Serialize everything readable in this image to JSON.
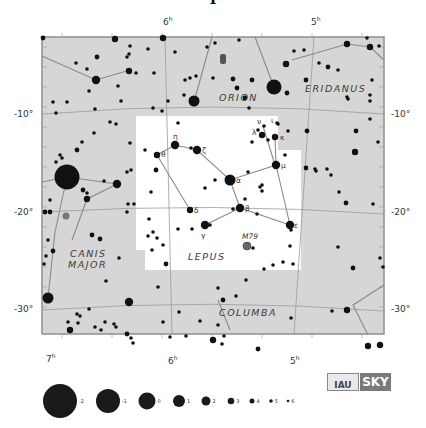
{
  "title_fragment": "Lepus",
  "colors": {
    "background": "#ffffff",
    "sky": "#d6d6d6",
    "lepus_area": "#ffffff",
    "grid": "#9a9a9a",
    "figure": "#8a8a8a",
    "star": "#111111",
    "border": "#8f8f8f"
  },
  "map": {
    "x": 42,
    "y": 37,
    "w": 342,
    "h": 297
  },
  "ra_labels": [
    {
      "text": "6",
      "sup": "h",
      "x": 163,
      "y": 25
    },
    {
      "text": "5",
      "sup": "h",
      "x": 311,
      "y": 25
    },
    {
      "text": "7",
      "sup": "h",
      "x": 46,
      "y": 362
    },
    {
      "text": "6",
      "sup": "h",
      "x": 168,
      "y": 364
    },
    {
      "text": "5",
      "sup": "h",
      "x": 290,
      "y": 364
    }
  ],
  "dec_labels": [
    {
      "text": "-10°",
      "x": 14,
      "y": 117,
      "side": "left"
    },
    {
      "text": "-20°",
      "x": 14,
      "y": 215,
      "side": "left"
    },
    {
      "text": "-30°",
      "x": 14,
      "y": 312,
      "side": "left"
    },
    {
      "text": "-10°",
      "x": 391,
      "y": 117,
      "side": "right"
    },
    {
      "text": "-20°",
      "x": 391,
      "y": 215,
      "side": "right"
    },
    {
      "text": "-30°",
      "x": 391,
      "y": 312,
      "side": "right"
    }
  ],
  "constellations": [
    {
      "name": "ORION",
      "x": 219,
      "y": 101
    },
    {
      "name": "ERIDANUS",
      "x": 305,
      "y": 92
    },
    {
      "name": "CANIS",
      "x": 70,
      "y": 257
    },
    {
      "name": "MAJOR",
      "x": 68,
      "y": 268
    },
    {
      "name": "LEPUS",
      "x": 188,
      "y": 260
    },
    {
      "name": "COLUMBA",
      "x": 219,
      "y": 316
    }
  ],
  "lepus_boundary": "M136,116 L278,116 L278,150 L301,150 L301,270 L145,270 L145,250 L136,250 Z",
  "grid_lines": [
    "M42,114 Q213,100 384,114",
    "M42,212 Q213,202 384,214",
    "M42,310 Q213,298 384,311",
    "M165,37 L172,334",
    "M314,37 L294,334"
  ],
  "figure_lines": [
    "M42,56 L96,80 L130,70",
    "M194,102 L212,37",
    "M274,87 L255,37",
    "M292,60 L347,44 L370,47 L384,60",
    "M42,182 L67,177 L117,184",
    "M67,177 L55,232 L48,298",
    "M117,184 L87,199 L72,240",
    "M157,155 L175,145 L197,150 L230,180 L276,165 L275,137",
    "M230,180 L240,208 L205,225",
    "M240,208 L290,225",
    "M157,155 L190,210",
    "M276,165 L290,225",
    "M263,126 L275,165",
    "M384,285 L353,305 L368,335",
    "M218,300 L230,330"
  ],
  "stars": [
    {
      "x": 43,
      "y": 38,
      "m": 4
    },
    {
      "x": 115,
      "y": 39,
      "m": 3
    },
    {
      "x": 163,
      "y": 38,
      "m": 3
    },
    {
      "x": 130,
      "y": 46,
      "m": 5
    },
    {
      "x": 129,
      "y": 54,
      "m": 5
    },
    {
      "x": 148,
      "y": 49,
      "m": 5
    },
    {
      "x": 175,
      "y": 52,
      "m": 5
    },
    {
      "x": 97,
      "y": 57,
      "m": 4
    },
    {
      "x": 127,
      "y": 57,
      "m": 5
    },
    {
      "x": 76,
      "y": 63,
      "m": 5
    },
    {
      "x": 87,
      "y": 69,
      "m": 5
    },
    {
      "x": 129,
      "y": 71,
      "m": 3
    },
    {
      "x": 136,
      "y": 73,
      "m": 5
    },
    {
      "x": 154,
      "y": 73,
      "m": 5
    },
    {
      "x": 96,
      "y": 80,
      "m": 2
    },
    {
      "x": 185,
      "y": 80,
      "m": 5
    },
    {
      "x": 89,
      "y": 91,
      "m": 5
    },
    {
      "x": 118,
      "y": 86,
      "m": 5
    },
    {
      "x": 121,
      "y": 101,
      "m": 5
    },
    {
      "x": 168,
      "y": 101,
      "m": 5
    },
    {
      "x": 184,
      "y": 95,
      "m": 5
    },
    {
      "x": 53,
      "y": 102,
      "m": 5
    },
    {
      "x": 67,
      "y": 102,
      "m": 5
    },
    {
      "x": 95,
      "y": 109,
      "m": 5
    },
    {
      "x": 56,
      "y": 113,
      "m": 5
    },
    {
      "x": 153,
      "y": 108,
      "m": 5
    },
    {
      "x": 162,
      "y": 111,
      "m": 5
    },
    {
      "x": 194,
      "y": 101,
      "m": 1
    },
    {
      "x": 215,
      "y": 43,
      "m": 5
    },
    {
      "x": 239,
      "y": 40,
      "m": 5
    },
    {
      "x": 207,
      "y": 47,
      "m": 5
    },
    {
      "x": 190,
      "y": 78,
      "m": 5
    },
    {
      "x": 196,
      "y": 76,
      "m": 5
    },
    {
      "x": 233,
      "y": 79,
      "m": 4
    },
    {
      "x": 245,
      "y": 98,
      "m": 4
    },
    {
      "x": 252,
      "y": 80,
      "m": 4
    },
    {
      "x": 213,
      "y": 78,
      "m": 5
    },
    {
      "x": 237,
      "y": 88,
      "m": 4
    },
    {
      "x": 274,
      "y": 87,
      "m": 0
    },
    {
      "x": 287,
      "y": 93,
      "m": 4
    },
    {
      "x": 286,
      "y": 64,
      "m": 3
    },
    {
      "x": 294,
      "y": 51,
      "m": 5
    },
    {
      "x": 304,
      "y": 50,
      "m": 5
    },
    {
      "x": 319,
      "y": 63,
      "m": 5
    },
    {
      "x": 328,
      "y": 67,
      "m": 4
    },
    {
      "x": 338,
      "y": 70,
      "m": 5
    },
    {
      "x": 306,
      "y": 80,
      "m": 4
    },
    {
      "x": 347,
      "y": 44,
      "m": 3
    },
    {
      "x": 370,
      "y": 47,
      "m": 3
    },
    {
      "x": 367,
      "y": 38,
      "m": 5
    },
    {
      "x": 379,
      "y": 46,
      "m": 5
    },
    {
      "x": 372,
      "y": 80,
      "m": 5
    },
    {
      "x": 370,
      "y": 95,
      "m": 5
    },
    {
      "x": 370,
      "y": 101,
      "m": 5
    },
    {
      "x": 347,
      "y": 97,
      "m": 5
    },
    {
      "x": 348,
      "y": 99,
      "m": 5
    },
    {
      "x": 249,
      "y": 108,
      "m": 5
    },
    {
      "x": 370,
      "y": 119,
      "m": 5
    },
    {
      "x": 356,
      "y": 131,
      "m": 4
    },
    {
      "x": 378,
      "y": 142,
      "m": 5
    },
    {
      "x": 355,
      "y": 152,
      "m": 3
    },
    {
      "x": 307,
      "y": 131,
      "m": 4
    },
    {
      "x": 306,
      "y": 168,
      "m": 4
    },
    {
      "x": 315,
      "y": 169,
      "m": 5
    },
    {
      "x": 316,
      "y": 171,
      "m": 5
    },
    {
      "x": 327,
      "y": 169,
      "m": 5
    },
    {
      "x": 331,
      "y": 175,
      "m": 5
    },
    {
      "x": 339,
      "y": 192,
      "m": 5
    },
    {
      "x": 346,
      "y": 203,
      "m": 4
    },
    {
      "x": 373,
      "y": 204,
      "m": 5
    },
    {
      "x": 338,
      "y": 247,
      "m": 5
    },
    {
      "x": 380,
      "y": 258,
      "m": 5
    },
    {
      "x": 383,
      "y": 267,
      "m": 5
    },
    {
      "x": 353,
      "y": 268,
      "m": 4
    },
    {
      "x": 332,
      "y": 311,
      "m": 5
    },
    {
      "x": 347,
      "y": 310,
      "m": 3
    },
    {
      "x": 368,
      "y": 346,
      "m": 3
    },
    {
      "x": 380,
      "y": 345,
      "m": 3
    },
    {
      "x": 110,
      "y": 122,
      "m": 5
    },
    {
      "x": 116,
      "y": 124,
      "m": 5
    },
    {
      "x": 94,
      "y": 133,
      "m": 5
    },
    {
      "x": 82,
      "y": 142,
      "m": 5
    },
    {
      "x": 130,
      "y": 143,
      "m": 5
    },
    {
      "x": 77,
      "y": 150,
      "m": 4
    },
    {
      "x": 60,
      "y": 155,
      "m": 5
    },
    {
      "x": 62,
      "y": 158,
      "m": 5
    },
    {
      "x": 56,
      "y": 162,
      "m": 5
    },
    {
      "x": 67,
      "y": 177,
      "m": -2
    },
    {
      "x": 117,
      "y": 184,
      "m": 2
    },
    {
      "x": 127,
      "y": 172,
      "m": 5
    },
    {
      "x": 131,
      "y": 170,
      "m": 5
    },
    {
      "x": 104,
      "y": 181,
      "m": 5
    },
    {
      "x": 83,
      "y": 190,
      "m": 4
    },
    {
      "x": 87,
      "y": 199,
      "m": 3
    },
    {
      "x": 87,
      "y": 193,
      "m": 5
    },
    {
      "x": 50,
      "y": 200,
      "m": 5
    },
    {
      "x": 45,
      "y": 212,
      "m": 4
    },
    {
      "x": 50,
      "y": 212,
      "m": 4
    },
    {
      "x": 128,
      "y": 204,
      "m": 5
    },
    {
      "x": 134,
      "y": 204,
      "m": 5
    },
    {
      "x": 127,
      "y": 212,
      "m": 5
    },
    {
      "x": 66,
      "y": 216,
      "m": "neb"
    },
    {
      "x": 92,
      "y": 235,
      "m": 4
    },
    {
      "x": 100,
      "y": 239,
      "m": 4
    },
    {
      "x": 48,
      "y": 240,
      "m": 5
    },
    {
      "x": 53,
      "y": 251,
      "m": 4
    },
    {
      "x": 46,
      "y": 256,
      "m": 5
    },
    {
      "x": 44,
      "y": 264,
      "m": 5
    },
    {
      "x": 119,
      "y": 258,
      "m": 5
    },
    {
      "x": 106,
      "y": 281,
      "m": 5
    },
    {
      "x": 48,
      "y": 298,
      "m": 1
    },
    {
      "x": 129,
      "y": 302,
      "m": 2
    },
    {
      "x": 89,
      "y": 309,
      "m": 5
    },
    {
      "x": 77,
      "y": 314,
      "m": 5
    },
    {
      "x": 80,
      "y": 316,
      "m": 5
    },
    {
      "x": 68,
      "y": 322,
      "m": 5
    },
    {
      "x": 78,
      "y": 323,
      "m": 5
    },
    {
      "x": 70,
      "y": 330,
      "m": 3
    },
    {
      "x": 95,
      "y": 327,
      "m": 5
    },
    {
      "x": 105,
      "y": 322,
      "m": 5
    },
    {
      "x": 101,
      "y": 330,
      "m": 5
    },
    {
      "x": 114,
      "y": 324,
      "m": 5
    },
    {
      "x": 116,
      "y": 327,
      "m": 5
    },
    {
      "x": 127,
      "y": 334,
      "m": 4
    },
    {
      "x": 131,
      "y": 338,
      "m": 5
    },
    {
      "x": 133,
      "y": 343,
      "m": 5
    },
    {
      "x": 158,
      "y": 287,
      "m": 5
    },
    {
      "x": 179,
      "y": 312,
      "m": 5
    },
    {
      "x": 163,
      "y": 322,
      "m": 5
    },
    {
      "x": 170,
      "y": 337,
      "m": 5
    },
    {
      "x": 186,
      "y": 336,
      "m": 5
    },
    {
      "x": 200,
      "y": 321,
      "m": 5
    },
    {
      "x": 218,
      "y": 325,
      "m": 5
    },
    {
      "x": 224,
      "y": 336,
      "m": 5
    },
    {
      "x": 213,
      "y": 340,
      "m": 3
    },
    {
      "x": 222,
      "y": 344,
      "m": 5
    },
    {
      "x": 218,
      "y": 288,
      "m": 5
    },
    {
      "x": 223,
      "y": 300,
      "m": 4
    },
    {
      "x": 236,
      "y": 296,
      "m": 5
    },
    {
      "x": 246,
      "y": 280,
      "m": 5
    },
    {
      "x": 258,
      "y": 349,
      "m": 4
    },
    {
      "x": 291,
      "y": 318,
      "m": 5
    },
    {
      "x": 157,
      "y": 155,
      "m": 3
    },
    {
      "x": 175,
      "y": 145,
      "m": 2
    },
    {
      "x": 191,
      "y": 148,
      "m": 5
    },
    {
      "x": 197,
      "y": 150,
      "m": 2
    },
    {
      "x": 145,
      "y": 150,
      "m": 5
    },
    {
      "x": 156,
      "y": 170,
      "m": 4
    },
    {
      "x": 151,
      "y": 192,
      "m": 5
    },
    {
      "x": 149,
      "y": 219,
      "m": 5
    },
    {
      "x": 153,
      "y": 232,
      "m": 5
    },
    {
      "x": 148,
      "y": 236,
      "m": 5
    },
    {
      "x": 157,
      "y": 238,
      "m": 5
    },
    {
      "x": 163,
      "y": 245,
      "m": 5
    },
    {
      "x": 178,
      "y": 123,
      "m": 5
    },
    {
      "x": 152,
      "y": 250,
      "m": 5
    },
    {
      "x": 166,
      "y": 264,
      "m": 4
    },
    {
      "x": 230,
      "y": 180,
      "m": 1
    },
    {
      "x": 215,
      "y": 180,
      "m": 5
    },
    {
      "x": 205,
      "y": 188,
      "m": 5
    },
    {
      "x": 248,
      "y": 172,
      "m": 5
    },
    {
      "x": 240,
      "y": 208,
      "m": 2
    },
    {
      "x": 233,
      "y": 209,
      "m": 5
    },
    {
      "x": 245,
      "y": 199,
      "m": 5
    },
    {
      "x": 257,
      "y": 214,
      "m": 5
    },
    {
      "x": 190,
      "y": 210,
      "m": 3
    },
    {
      "x": 205,
      "y": 225,
      "m": 2
    },
    {
      "x": 210,
      "y": 225,
      "m": 5
    },
    {
      "x": 178,
      "y": 229,
      "m": 5
    },
    {
      "x": 192,
      "y": 229,
      "m": 5
    },
    {
      "x": 247,
      "y": 246,
      "m": "m79"
    },
    {
      "x": 253,
      "y": 248,
      "m": 5
    },
    {
      "x": 276,
      "y": 165,
      "m": 2
    },
    {
      "x": 262,
      "y": 135,
      "m": 3
    },
    {
      "x": 275,
      "y": 137,
      "m": 3
    },
    {
      "x": 258,
      "y": 130,
      "m": 5
    },
    {
      "x": 264,
      "y": 126,
      "m": 5
    },
    {
      "x": 278,
      "y": 124,
      "m": 5
    },
    {
      "x": 268,
      "y": 140,
      "m": 5
    },
    {
      "x": 252,
      "y": 142,
      "m": 5
    },
    {
      "x": 290,
      "y": 225,
      "m": 2
    },
    {
      "x": 291,
      "y": 230,
      "m": 5
    },
    {
      "x": 262,
      "y": 185,
      "m": 5
    },
    {
      "x": 260,
      "y": 187,
      "m": 5
    },
    {
      "x": 262,
      "y": 191,
      "m": 5
    },
    {
      "x": 290,
      "y": 246,
      "m": 5
    },
    {
      "x": 293,
      "y": 264,
      "m": 5
    },
    {
      "x": 283,
      "y": 262,
      "m": 5
    },
    {
      "x": 273,
      "y": 265,
      "m": 5
    },
    {
      "x": 264,
      "y": 269,
      "m": 5
    },
    {
      "x": 277,
      "y": 123,
      "m": 5
    },
    {
      "x": 288,
      "y": 131,
      "m": 5
    },
    {
      "x": 285,
      "y": 155,
      "m": 5
    }
  ],
  "greek_labels": [
    {
      "t": "η",
      "x": 173,
      "y": 139
    },
    {
      "t": "θ",
      "x": 161,
      "y": 157
    },
    {
      "t": "ζ",
      "x": 202,
      "y": 153
    },
    {
      "t": "α",
      "x": 236,
      "y": 183
    },
    {
      "t": "μ",
      "x": 281,
      "y": 168
    },
    {
      "t": "λ",
      "x": 252,
      "y": 135
    },
    {
      "t": "κ",
      "x": 280,
      "y": 140
    },
    {
      "t": "ν",
      "x": 257,
      "y": 124
    },
    {
      "t": "ι",
      "x": 271,
      "y": 123
    },
    {
      "t": "β",
      "x": 245,
      "y": 211
    },
    {
      "t": "δ",
      "x": 194,
      "y": 213
    },
    {
      "t": "γ",
      "x": 201,
      "y": 238
    },
    {
      "t": "ε",
      "x": 294,
      "y": 228
    }
  ],
  "special_labels": [
    {
      "t": "M79",
      "x": 242,
      "y": 239
    }
  ],
  "legend": {
    "items": [
      {
        "mag": "-2",
        "x": 60,
        "r": 17
      },
      {
        "mag": "-1",
        "x": 108,
        "r": 12
      },
      {
        "mag": "0",
        "x": 147,
        "r": 8.5
      },
      {
        "mag": "1",
        "x": 179,
        "r": 6
      },
      {
        "mag": "2",
        "x": 206,
        "r": 4.5
      },
      {
        "mag": "3",
        "x": 231,
        "r": 3.3
      },
      {
        "mag": "4",
        "x": 252,
        "r": 2.5
      },
      {
        "mag": "5",
        "x": 271,
        "r": 1.8
      },
      {
        "mag": "6",
        "x": 288,
        "r": 1.3
      }
    ],
    "y": 401
  },
  "logo": {
    "left": "IAU",
    "right": "SKY"
  }
}
